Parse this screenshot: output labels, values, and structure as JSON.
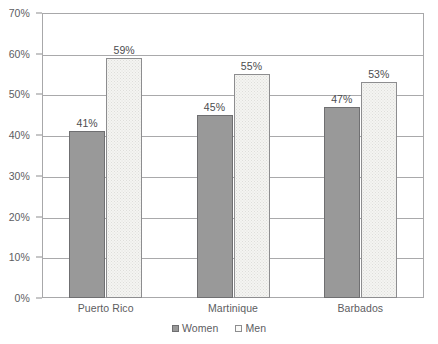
{
  "chart_data": {
    "type": "bar",
    "title": "",
    "subtitle": "",
    "xlabel": "",
    "ylabel": "",
    "categories": [
      "Puerto Rico",
      "Martinique",
      "Barbados"
    ],
    "series": [
      {
        "name": "Women",
        "values": [
          41,
          45,
          47
        ],
        "labels": [
          "41%",
          "45%",
          "47%"
        ],
        "color": "#999999",
        "border_color": "#6f6f71"
      },
      {
        "name": "Men",
        "values": [
          59,
          55,
          53
        ],
        "labels": [
          "59%",
          "55%",
          "53%"
        ],
        "color": "#f4f4f2",
        "border_color": "#8d8d8f"
      }
    ],
    "ylim": [
      0,
      70
    ],
    "ytick_values": [
      0,
      10,
      20,
      30,
      40,
      50,
      60,
      70
    ],
    "ytick_labels": [
      "0%",
      "10%",
      "20%",
      "30%",
      "40%",
      "50%",
      "60%",
      "70%"
    ],
    "grid": true,
    "grid_axis": "y",
    "legend_position": "bottom-center",
    "value_format": "percent",
    "data_labels_shown": true,
    "background_color": "#ffffff",
    "grid_color": "#a9a9ab",
    "frame_color": "#a8a8aa"
  }
}
